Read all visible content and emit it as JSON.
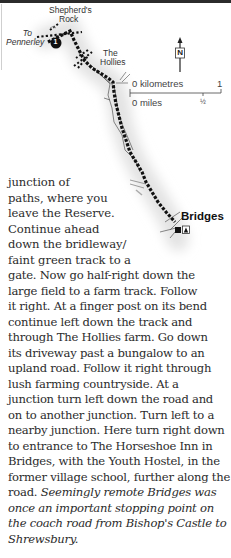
{
  "map": {
    "labels": {
      "shepherds_rock_line1": "Shepherd's",
      "shepherds_rock_line2": "Rock",
      "to_pennerley_line1": "To",
      "to_pennerley_line2": "Pennerley",
      "the_hollies_line1": "The",
      "the_hollies_line2": "Hollies",
      "bridges": "Bridges",
      "waypoint_number": "1"
    },
    "north_arrow": {
      "letter": "N"
    },
    "scale": {
      "km_label": "0 kilometres",
      "km_end": "1",
      "miles_label": "0 miles",
      "miles_mid": "½"
    },
    "icons": [
      "pub-icon",
      "youth-hostel-icon"
    ]
  },
  "text": {
    "narrow_lines": [
      "junction of",
      "paths, where you",
      "leave the Reserve.",
      "Continue ahead",
      "down the bridleway/",
      "faint green track to a"
    ],
    "wide_lines": [
      "gate. Now go half-right down the",
      "large field to a farm track. Follow",
      "it right. At a finger post on its bend",
      "continue left down the track and",
      "through The Hollies farm. Go down",
      "its driveway past a bungalow to an",
      "upland road. Follow it right through",
      "lush farming countryside. At a",
      "junction turn left down the road and",
      "on to another junction. Turn left to a",
      "nearby junction. Here turn right down",
      "to entrance to The Horseshoe Inn in",
      "Bridges, with the Youth Hostel, in the",
      "former village school, further along the"
    ],
    "mixed_line": {
      "normal": "road. ",
      "italic": "Seemingly remote Bridges was"
    },
    "italic_lines": [
      "once an important stopping point on",
      "the coach road from Bishop's Castle to",
      "Shrewsbury."
    ]
  },
  "colors": {
    "route": "#111111",
    "shadow": "#e6e6e6",
    "text": "#2b2b2b"
  }
}
